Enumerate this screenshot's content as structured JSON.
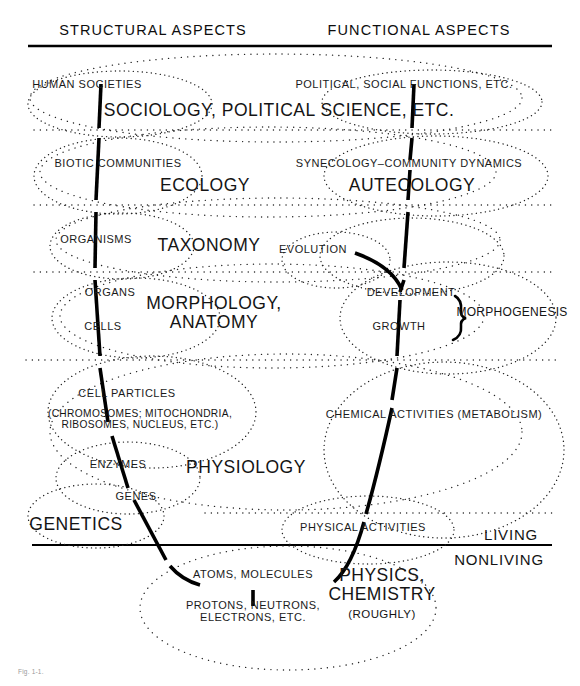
{
  "figure": {
    "headers": {
      "structural": "STRUCTURAL ASPECTS",
      "functional": "FUNCTIONAL ASPECTS"
    },
    "side_labels": {
      "living": "LIVING",
      "nonliving": "NONLIVING"
    },
    "disciplines": [
      {
        "id": "sociology",
        "label": "SOCIOLOGY, POLITICAL SCIENCE, ETC."
      },
      {
        "id": "ecology",
        "label": "ECOLOGY"
      },
      {
        "id": "autecology",
        "label": "AUTECOLOGY"
      },
      {
        "id": "taxonomy",
        "label": "TAXONOMY"
      },
      {
        "id": "morphology",
        "label": "MORPHOLOGY,\nANATOMY"
      },
      {
        "id": "physiology",
        "label": "PHYSIOLOGY"
      },
      {
        "id": "genetics",
        "label": "GENETICS"
      },
      {
        "id": "physics-chemistry",
        "label": "PHYSICS,\nCHEMISTRY"
      },
      {
        "id": "physics-chemistry-roughly",
        "label": "(ROUGHLY)"
      }
    ],
    "structural_components": [
      {
        "id": "human-societies",
        "label": "HUMAN SOCIETIES"
      },
      {
        "id": "biotic-communities",
        "label": "BIOTIC COMMUNITIES"
      },
      {
        "id": "organisms",
        "label": "ORGANISMS"
      },
      {
        "id": "organs",
        "label": "ORGANS"
      },
      {
        "id": "cells",
        "label": "CELLS"
      },
      {
        "id": "cell-particles",
        "label": "CELL PARTICLES"
      },
      {
        "id": "cell-particles-detail",
        "label": "(CHROMOSOMES; MITOCHONDRIA,\nRIBOSOMES, NUCLEUS, ETC.)"
      },
      {
        "id": "enzymes",
        "label": "ENZYMES"
      },
      {
        "id": "genes",
        "label": "GENES"
      },
      {
        "id": "atoms-molecules",
        "label": "ATOMS, MOLECULES"
      },
      {
        "id": "subatomic",
        "label": "PROTONS, NEUTRONS,\nELECTRONS, ETC."
      }
    ],
    "functional_components": [
      {
        "id": "political-social-functions",
        "label": "POLITICAL, SOCIAL FUNCTIONS, ETC."
      },
      {
        "id": "synecology",
        "label": "SYNECOLOGY–COMMUNITY DYNAMICS"
      },
      {
        "id": "evolution",
        "label": "EVOLUTION"
      },
      {
        "id": "development",
        "label": "DEVELOPMENT"
      },
      {
        "id": "growth",
        "label": "GROWTH"
      },
      {
        "id": "morphogenesis",
        "label": "MORPHOGENESIS"
      },
      {
        "id": "chemical-activities",
        "label": "CHEMICAL ACTIVITIES (METABOLISM)"
      },
      {
        "id": "physical-activities",
        "label": "PHYSICAL ACTIVITIES"
      }
    ],
    "caption": "Fig. 1-1.",
    "colors": {
      "ink": "#111111",
      "rule": "#000000",
      "dotted": "#2a2a2a",
      "background": "#ffffff"
    }
  }
}
